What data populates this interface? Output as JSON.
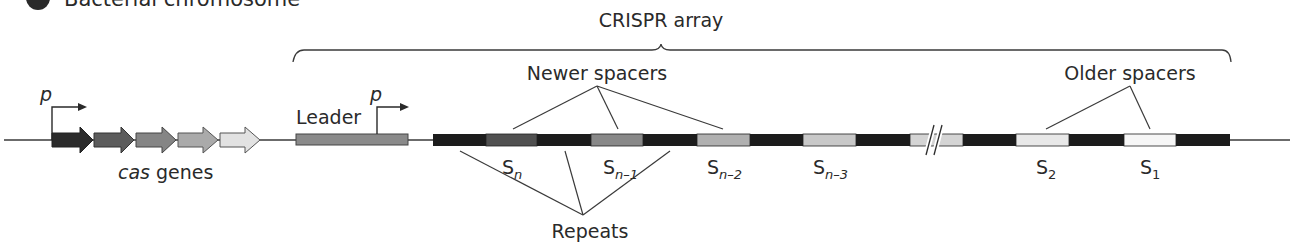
{
  "header": {
    "badge": "1",
    "title": "Bacterial chromosome"
  },
  "labels": {
    "crispr_array": "CRISPR array",
    "newer_spacers": "Newer spacers",
    "older_spacers": "Older spacers",
    "repeats": "Repeats",
    "leader": "Leader",
    "cas_genes_italic": "cas",
    "cas_genes_rest": " genes",
    "promoter_cas": "p",
    "promoter_leader": "p"
  },
  "spacers": [
    {
      "base": "S",
      "sub": "n"
    },
    {
      "base": "S",
      "sub": "n–1"
    },
    {
      "base": "S",
      "sub": "n–2"
    },
    {
      "base": "S",
      "sub": "n–3"
    },
    {
      "base": "S",
      "sub": "2"
    },
    {
      "base": "S",
      "sub": "1"
    }
  ],
  "colors": {
    "line": "#3a3a3a",
    "repeat": "#1c1c1c",
    "leader": "#8a8a8a",
    "cas_genes": [
      "#2b2b2b",
      "#5c5c5c",
      "#858585",
      "#aaaaaa",
      "#d4d4d4"
    ],
    "spacers": [
      "#505050",
      "#888888",
      "#b0b0b0",
      "#c8c8c8",
      "#e8e8e8",
      "#f6f6f6"
    ]
  }
}
